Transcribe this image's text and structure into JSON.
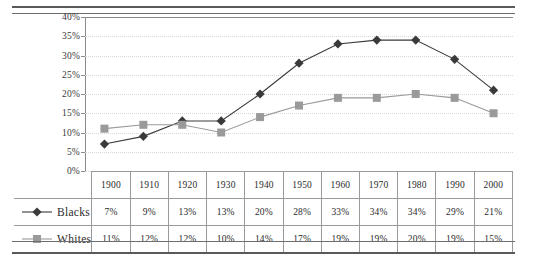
{
  "chart_data": {
    "type": "line",
    "title": "",
    "subtitle": "",
    "xlabel": "",
    "ylabel": "",
    "categories": [
      "1900",
      "1910",
      "1920",
      "1930",
      "1940",
      "1950",
      "1960",
      "1970",
      "1980",
      "1990",
      "2000"
    ],
    "series": [
      {
        "name": "Blacks",
        "marker": "diamond",
        "color": "#3a3a3a",
        "values": [
          7,
          9,
          13,
          13,
          20,
          28,
          33,
          34,
          34,
          29,
          21
        ],
        "labels": [
          "7%",
          "9%",
          "13%",
          "13%",
          "20%",
          "28%",
          "33%",
          "34%",
          "34%",
          "29%",
          "21%"
        ]
      },
      {
        "name": "Whites",
        "marker": "square",
        "color": "#9a9a9a",
        "values": [
          11,
          12,
          12,
          10,
          14,
          17,
          19,
          19,
          20,
          19,
          15
        ],
        "labels": [
          "11%",
          "12%",
          "12%",
          "10%",
          "14%",
          "17%",
          "19%",
          "19%",
          "20%",
          "19%",
          "15%"
        ]
      }
    ],
    "ylim": [
      0,
      40
    ],
    "ytick_values": [
      0,
      5,
      10,
      15,
      20,
      25,
      30,
      35,
      40
    ],
    "ytick_labels": [
      "0%",
      "5%",
      "10%",
      "15%",
      "20%",
      "25%",
      "30%",
      "35%",
      "40%"
    ],
    "grid": true,
    "grid_axis": "y",
    "legend_position": "table-left-column"
  },
  "table": {
    "legend_header": "",
    "rows": [
      {
        "label": "Blacks",
        "marker": "diamond"
      },
      {
        "label": "Whites",
        "marker": "square"
      }
    ]
  }
}
